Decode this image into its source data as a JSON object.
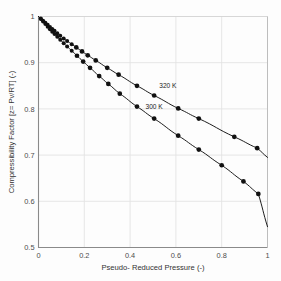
{
  "chart_data": {
    "type": "scatter",
    "title": "",
    "xlabel": "Pseudo- Reduced Pressure (-)",
    "ylabel": "Compressibility Factor [z= Pv/RT] (-)",
    "xlim": [
      0,
      1
    ],
    "ylim": [
      0.5,
      1
    ],
    "xticks": [
      "0",
      "0.2",
      "0.4",
      "0.6",
      "0.8",
      "1"
    ],
    "xtick_values": [
      0,
      0.2,
      0.4,
      0.6,
      0.8,
      1
    ],
    "yticks": [
      "0.5",
      "0.6",
      "0.7",
      "0.8",
      "0.9",
      "1"
    ],
    "ytick_values": [
      0.5,
      0.6,
      0.7,
      0.8,
      0.9,
      1
    ],
    "grid": true,
    "legend_position": "inline-annotation",
    "series": [
      {
        "name": "320 K",
        "label": "320 K",
        "annotation_x": 0.565,
        "annotation_y": 0.845,
        "marker": "filled-circle",
        "color": "#111111",
        "x": [
          0.01,
          0.02,
          0.03,
          0.04,
          0.05,
          0.06,
          0.07,
          0.082,
          0.095,
          0.11,
          0.125,
          0.145,
          0.165,
          0.19,
          0.215,
          0.25,
          0.3,
          0.35,
          0.43,
          0.505,
          0.61,
          0.7,
          0.855,
          0.955
        ],
        "y": [
          0.9955,
          0.991,
          0.9865,
          0.982,
          0.9775,
          0.973,
          0.969,
          0.964,
          0.9585,
          0.9525,
          0.947,
          0.94,
          0.933,
          0.9245,
          0.916,
          0.905,
          0.889,
          0.874,
          0.85,
          0.829,
          0.801,
          0.779,
          0.7395,
          0.715
        ],
        "endpoint": {
          "x": 1.0,
          "y": 0.695
        }
      },
      {
        "name": "300 K",
        "label": "300 K",
        "annotation_x": 0.505,
        "annotation_y": 0.8,
        "marker": "filled-circle",
        "color": "#111111",
        "x": [
          0.01,
          0.02,
          0.03,
          0.04,
          0.05,
          0.06,
          0.07,
          0.082,
          0.095,
          0.11,
          0.125,
          0.145,
          0.168,
          0.195,
          0.225,
          0.265,
          0.305,
          0.355,
          0.43,
          0.505,
          0.61,
          0.7,
          0.8,
          0.895,
          0.96
        ],
        "y": [
          0.9945,
          0.989,
          0.9835,
          0.978,
          0.9725,
          0.967,
          0.962,
          0.956,
          0.9495,
          0.942,
          0.935,
          0.926,
          0.915,
          0.9025,
          0.889,
          0.871,
          0.854,
          0.833,
          0.805,
          0.779,
          0.742,
          0.712,
          0.678,
          0.643,
          0.616
        ],
        "endpoint": {
          "x": 1.0,
          "y": 0.545
        }
      }
    ]
  }
}
